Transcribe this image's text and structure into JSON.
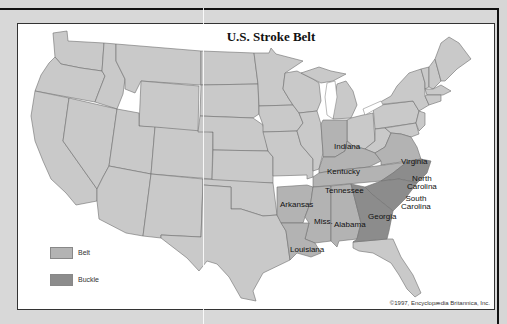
{
  "title": "U.S. Stroke Belt",
  "colors": {
    "base": "#c9c9c9",
    "belt": "#b3b3b3",
    "buckle": "#8c8c8c",
    "background": "#d6d6d6",
    "panel": "#ffffff"
  },
  "legend": {
    "items": [
      {
        "label": "Belt",
        "color": "#b3b3b3"
      },
      {
        "label": "Buckle",
        "color": "#8c8c8c"
      }
    ]
  },
  "states": {
    "belt": [
      "Indiana",
      "Kentucky",
      "Virginia",
      "Tennessee",
      "Arkansas",
      "Miss.",
      "Alabama",
      "Louisiana"
    ],
    "buckle": [
      "North Carolina",
      "South Carolina",
      "Georgia"
    ]
  },
  "labels": {
    "indiana": "Indiana",
    "kentucky": "Kentucky",
    "virginia": "Virginia",
    "tennessee": "Tennessee",
    "north_carolina_1": "North",
    "north_carolina_2": "Carolina",
    "south_carolina_1": "South",
    "south_carolina_2": "Carolina",
    "arkansas": "Arkansas",
    "mississippi": "Miss.",
    "alabama": "Alabama",
    "georgia": "Georgia",
    "louisiana": "Louisiana"
  },
  "copyright": "©1997, Encyclopædia Britannica, Inc."
}
